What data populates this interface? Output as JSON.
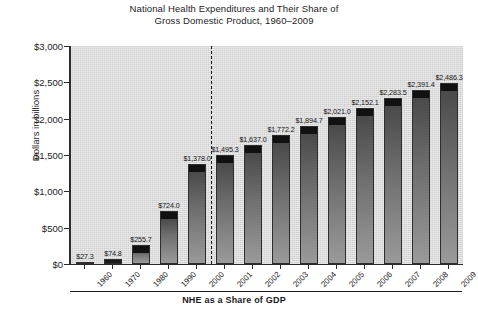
{
  "chart_data": {
    "type": "bar",
    "title": "National Health Expenditures and Their Share of Gross Domestic Product, 1960–2009",
    "title_line1": "National Health Expenditures and Their Share of",
    "title_line2": "Gross Domestic Product, 1960–2009",
    "xlabel": "",
    "ylabel": "Dollars in billions",
    "caption": "NHE as a Share of GDP",
    "ylim": [
      0,
      3000
    ],
    "yticks": [
      0,
      500,
      1000,
      1500,
      2000,
      2500,
      3000
    ],
    "ytick_labels": [
      "$0",
      "$500",
      "$1,000",
      "$1,500",
      "$2,000",
      "$2,500",
      "$3,000"
    ],
    "grid": false,
    "legend": "none",
    "categories": [
      "1960",
      "1970",
      "1980",
      "1990",
      "2000",
      "2001",
      "2002",
      "2003",
      "2004",
      "2005",
      "2006",
      "2007",
      "2008",
      "2009"
    ],
    "values": [
      27.3,
      74.8,
      255.7,
      724.0,
      1378.0,
      1495.3,
      1637.0,
      1772.2,
      1894.7,
      2021.0,
      2152.1,
      2283.5,
      2391.4,
      2486.3
    ],
    "data_labels": [
      "$27.3",
      "$74.8",
      "$255.7",
      "$724.0",
      "$1,378.0",
      "$1,495.3",
      "$1,637.0",
      "$1,772.2",
      "$1,894.7",
      "$2,021.0",
      "$2,152.1",
      "$2,283.5",
      "$2,391.4",
      "$2,486.3"
    ],
    "annotations": [
      {
        "name": "decade-to-annual-divider",
        "type": "vertical-dashed-line",
        "between": [
          "2000",
          "2001"
        ]
      }
    ],
    "colors": {
      "plot_background": "#cfcfcf",
      "bar_top": "#111111",
      "bar_bottom": "#9a9a9a",
      "axis": "#2b2b2b",
      "text": "#232323",
      "page_background": "#ffffff"
    }
  }
}
